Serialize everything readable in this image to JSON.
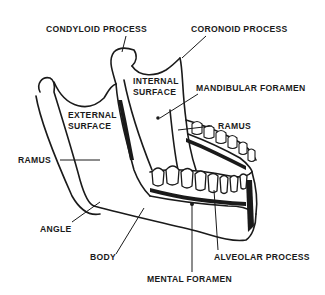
{
  "figure": {
    "labels": {
      "condyloid_process": "CONDYLOID PROCESS",
      "coronoid_process": "CORONOID PROCESS",
      "internal_surface_1": "INTERNAL",
      "internal_surface_2": "SURFACE",
      "mandibular_foramen": "MANDIBULAR FORAMEN",
      "external_surface_1": "EXTERNAL",
      "external_surface_2": "SURFACE",
      "ramus_right": "RAMUS",
      "ramus_left": "RAMUS",
      "angle": "ANGLE",
      "body": "BODY",
      "alveolar_process": "ALVEOLAR PROCESS",
      "mental_foramen": "MENTAL FORAMEN"
    },
    "colors": {
      "ink": "#1a1a1a",
      "background": "#ffffff"
    }
  }
}
